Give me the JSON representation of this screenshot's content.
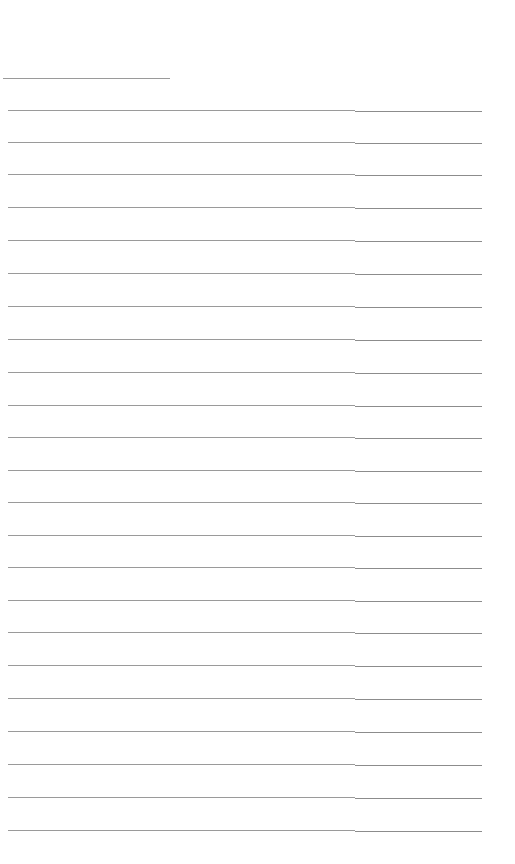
{
  "page": {
    "type": "ruled-lines-blank",
    "background": "#ffffff",
    "line_color": "#9a9a9a",
    "header_line": {
      "y": 78,
      "x1": 3,
      "x2": 170
    },
    "ruled_lines": {
      "x1": 8,
      "split_x": 355,
      "x2": 482,
      "y_positions": [
        110,
        142,
        174,
        207,
        240,
        273,
        306,
        339,
        372,
        405,
        437,
        470,
        502,
        535,
        567,
        600,
        632,
        665,
        698,
        731,
        764,
        797,
        830
      ]
    }
  }
}
